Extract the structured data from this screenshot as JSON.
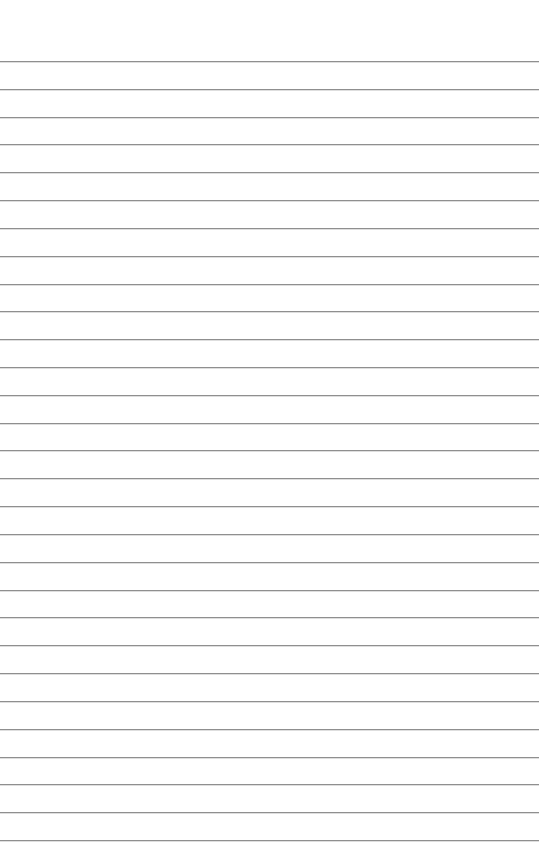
{
  "document": {
    "type": "lined-paper",
    "background_color": "#ffffff",
    "rule_color": "#8f8f8f",
    "rule_count": 29,
    "first_rule_y": 61,
    "rule_spacing": 27.82
  }
}
